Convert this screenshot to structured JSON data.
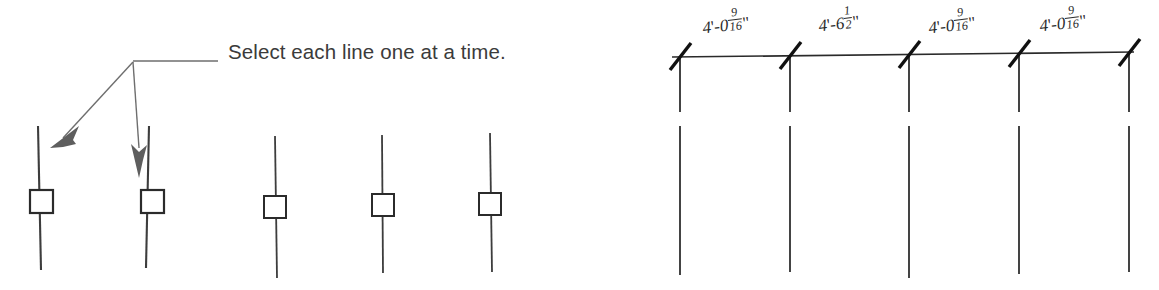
{
  "canvas": {
    "width": 1159,
    "height": 290,
    "background": "#ffffff"
  },
  "stroke_colors": {
    "object_line": "#3d3d3d",
    "grip_square": "#2b2b2b",
    "leader": "#6e6e6e",
    "dimension_line": "#2a2a2a",
    "text": "#3b3b3b"
  },
  "left_panel": {
    "annotation": {
      "text": "Select each line one at a time.",
      "leader_label": "leader-line-with-two-arrows"
    },
    "lines": [
      {
        "id": "line-1",
        "x": 38,
        "top": 126,
        "bottom": 270,
        "grip": {
          "x": 30,
          "y": 190,
          "size": 23
        },
        "pointed_at": true
      },
      {
        "id": "line-2",
        "x": 149,
        "top": 126,
        "bottom": 268,
        "grip": {
          "x": 141,
          "y": 190,
          "size": 23
        },
        "pointed_at": true
      },
      {
        "id": "line-3",
        "x": 275,
        "top": 136,
        "bottom": 278,
        "grip": {
          "x": 264,
          "y": 196,
          "size": 22
        },
        "pointed_at": false
      },
      {
        "id": "line-4",
        "x": 382,
        "top": 135,
        "bottom": 273,
        "grip": {
          "x": 372,
          "y": 194,
          "size": 22
        },
        "pointed_at": false
      },
      {
        "id": "line-5",
        "x": 490,
        "top": 133,
        "bottom": 272,
        "grip": {
          "x": 479,
          "y": 193,
          "size": 22
        },
        "pointed_at": false
      }
    ]
  },
  "right_panel": {
    "title": "dimension-string",
    "dimension_line": {
      "y": 55,
      "x_start": 672,
      "x_end": 1134
    },
    "tick_marks": [
      {
        "x": 680,
        "style": "architectural-slash"
      },
      {
        "x": 788,
        "style": "architectural-slash"
      },
      {
        "x": 908,
        "style": "architectural-slash"
      },
      {
        "x": 1018,
        "style": "architectural-slash"
      },
      {
        "x": 1128,
        "style": "architectural-slash"
      }
    ],
    "extension_lines": [
      {
        "x": 680,
        "upper_top": 56,
        "upper_bottom": 112,
        "lower_top": 126,
        "lower_bottom": 275
      },
      {
        "x": 790,
        "upper_top": 56,
        "upper_bottom": 112,
        "lower_top": 126,
        "lower_bottom": 272
      },
      {
        "x": 909,
        "upper_top": 56,
        "upper_bottom": 112,
        "lower_top": 126,
        "lower_bottom": 278
      },
      {
        "x": 1019,
        "upper_top": 56,
        "upper_bottom": 112,
        "lower_top": 126,
        "lower_bottom": 274
      },
      {
        "x": 1129,
        "upper_top": 56,
        "upper_bottom": 112,
        "lower_top": 126,
        "lower_bottom": 272
      }
    ],
    "dimensions": [
      {
        "id": "dim-1",
        "feet": "4",
        "inches": "0",
        "fraction_numerator": "9",
        "fraction_denominator": "16",
        "full_text": "4'-0 9/16\"",
        "x": 704,
        "y": 40
      },
      {
        "id": "dim-2",
        "feet": "4",
        "inches": "6",
        "fraction_numerator": "1",
        "fraction_denominator": "2",
        "full_text": "4'-6 1/2\"",
        "x": 820,
        "y": 38
      },
      {
        "id": "dim-3",
        "feet": "4",
        "inches": "0",
        "fraction_numerator": "9",
        "fraction_denominator": "16",
        "full_text": "4'-0 9/16\"",
        "x": 930,
        "y": 40
      },
      {
        "id": "dim-4",
        "feet": "4",
        "inches": "0",
        "fraction_numerator": "9",
        "fraction_denominator": "16",
        "full_text": "4'-0 9/16\"",
        "x": 1041,
        "y": 38
      }
    ],
    "symbols": {
      "feet_mark": "'",
      "inch_mark": "\"",
      "dash": "-"
    }
  }
}
